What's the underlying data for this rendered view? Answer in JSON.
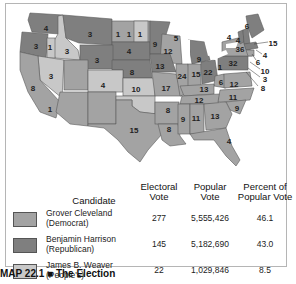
{
  "colors": {
    "democrat": "#a3a3a3",
    "republican": "#7f7f7f",
    "peoples": "#c8c8c8",
    "border": "#555555"
  },
  "map": {
    "state_labels": [
      {
        "text": "4",
        "x": 46,
        "y": 28
      },
      {
        "text": "3",
        "x": 36,
        "y": 46
      },
      {
        "text": "1",
        "x": 50,
        "y": 47
      },
      {
        "text": "3",
        "x": 67,
        "y": 51
      },
      {
        "text": "3",
        "x": 90,
        "y": 34
      },
      {
        "text": "1",
        "x": 118,
        "y": 34
      },
      {
        "text": "1",
        "x": 129,
        "y": 34
      },
      {
        "text": "1",
        "x": 140,
        "y": 34
      },
      {
        "text": "3",
        "x": 97,
        "y": 60
      },
      {
        "text": "4",
        "x": 129,
        "y": 51
      },
      {
        "text": "9",
        "x": 155,
        "y": 44
      },
      {
        "text": "5",
        "x": 176,
        "y": 38
      },
      {
        "text": "12",
        "x": 168,
        "y": 51
      },
      {
        "text": "3",
        "x": 51,
        "y": 76
      },
      {
        "text": "8",
        "x": 33,
        "y": 88
      },
      {
        "text": "8",
        "x": 132,
        "y": 72
      },
      {
        "text": "13",
        "x": 160,
        "y": 66
      },
      {
        "text": "9",
        "x": 199,
        "y": 59
      },
      {
        "text": "4",
        "x": 103,
        "y": 85
      },
      {
        "text": "10",
        "x": 136,
        "y": 89
      },
      {
        "text": "17",
        "x": 166,
        "y": 88
      },
      {
        "text": "24",
        "x": 182,
        "y": 76
      },
      {
        "text": "15",
        "x": 196,
        "y": 74
      },
      {
        "text": "22",
        "x": 208,
        "y": 72
      },
      {
        "text": "1",
        "x": 220,
        "y": 67
      },
      {
        "text": "32",
        "x": 233,
        "y": 63
      },
      {
        "text": "36",
        "x": 240,
        "y": 49
      },
      {
        "text": "4",
        "x": 229,
        "y": 37
      },
      {
        "text": "4",
        "x": 238,
        "y": 40
      },
      {
        "text": "6",
        "x": 247,
        "y": 26
      },
      {
        "text": "15",
        "x": 273,
        "y": 43
      },
      {
        "text": "4",
        "x": 265,
        "y": 55
      },
      {
        "text": "6",
        "x": 258,
        "y": 62
      },
      {
        "text": "10",
        "x": 265,
        "y": 71
      },
      {
        "text": "3",
        "x": 265,
        "y": 79
      },
      {
        "text": "8",
        "x": 263,
        "y": 88
      },
      {
        "text": "6",
        "x": 221,
        "y": 82
      },
      {
        "text": "12",
        "x": 234,
        "y": 84
      },
      {
        "text": "13",
        "x": 204,
        "y": 89
      },
      {
        "text": "11",
        "x": 233,
        "y": 97
      },
      {
        "text": "12",
        "x": 199,
        "y": 100
      },
      {
        "text": "9",
        "x": 237,
        "y": 108
      },
      {
        "text": "1",
        "x": 50,
        "y": 109
      },
      {
        "text": "8",
        "x": 168,
        "y": 110
      },
      {
        "text": "9",
        "x": 183,
        "y": 119
      },
      {
        "text": "11",
        "x": 196,
        "y": 118
      },
      {
        "text": "13",
        "x": 215,
        "y": 116
      },
      {
        "text": "15",
        "x": 134,
        "y": 130
      },
      {
        "text": "8",
        "x": 169,
        "y": 129
      },
      {
        "text": "4",
        "x": 229,
        "y": 141
      }
    ]
  },
  "table": {
    "headers": {
      "candidate": "Candidate",
      "electoral_1": "Electoral",
      "electoral_2": "Vote",
      "popular_1": "Popular",
      "popular_2": "Vote",
      "percent_1": "Percent of",
      "percent_2": "Popular Vote"
    },
    "rows": [
      {
        "name": "Grover Cleveland",
        "party": "(Democrat)",
        "electoral": "277",
        "popular": "5,555,426",
        "percent": "46.1"
      },
      {
        "name": "Benjamin Harrison",
        "party": "(Republican)",
        "electoral": "145",
        "popular": "5,182,690",
        "percent": "43.0"
      },
      {
        "name": "James B. Weaver",
        "party": "(People's)",
        "electoral": "22",
        "popular": "1,029,846",
        "percent": "8.5"
      }
    ]
  },
  "caption": "MAP 22.1 ■ The Election"
}
